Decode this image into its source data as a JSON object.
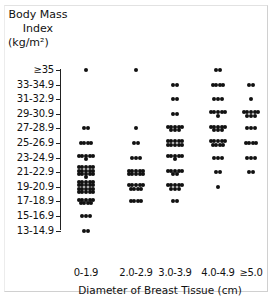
{
  "chart_data": {
    "type": "scatter",
    "subtype": "dot-strip-plot",
    "title": "",
    "ylabel": "Body Mass Index (kg/m²)",
    "ylabel_lines": [
      "Body Mass",
      "Index",
      "(kg/m²)"
    ],
    "xlabel": "Diameter of Breast Tissue (cm)",
    "y_categories": [
      "≥35",
      "33-34.9",
      "31-32.9",
      "29-30.9",
      "27-28.9",
      "25-26.9",
      "23-24.9",
      "21-22.9",
      "19-20.9",
      "17-18.9",
      "15-16.9",
      "13-14.9"
    ],
    "x_categories": [
      "0-1.9",
      "2.0-2.9",
      "3.0-3.9",
      "4.0-4.9",
      "≥5.0"
    ],
    "grid": false,
    "legend": null,
    "counts_by_column": {
      "0-1.9": {
        "≥35": 1,
        "33-34.9": 0,
        "31-32.9": 0,
        "29-30.9": 0,
        "27-28.9": 2,
        "25-26.9": 4,
        "23-24.9": 6,
        "21-22.9": 16,
        "19-20.9": 20,
        "17-18.9": 9,
        "15-16.9": 3,
        "13-14.9": 2
      },
      "2.0-2.9": {
        "≥35": 1,
        "33-34.9": 0,
        "31-32.9": 0,
        "29-30.9": 0,
        "27-28.9": 1,
        "25-26.9": 2,
        "23-24.9": 3,
        "21-22.9": 10,
        "19-20.9": 9,
        "17-18.9": 4,
        "15-16.9": 0,
        "13-14.9": 0
      },
      "3.0-3.9": {
        "≥35": 0,
        "33-34.9": 2,
        "31-32.9": 2,
        "29-30.9": 2,
        "27-28.9": 8,
        "25-26.9": 10,
        "23-24.9": 6,
        "21-22.9": 7,
        "19-20.9": 8,
        "17-18.9": 2,
        "15-16.9": 0,
        "13-14.9": 0
      },
      "4.0-4.9": {
        "≥35": 2,
        "33-34.9": 4,
        "31-32.9": 3,
        "29-30.9": 6,
        "27-28.9": 8,
        "25-26.9": 9,
        "23-24.9": 3,
        "21-22.9": 2,
        "19-20.9": 1,
        "17-18.9": 0,
        "15-16.9": 0,
        "13-14.9": 0
      },
      "≥5.0": {
        "≥35": 0,
        "33-34.9": 2,
        "31-32.9": 1,
        "29-30.9": 8,
        "27-28.9": 3,
        "25-26.9": 4,
        "23-24.9": 3,
        "21-22.9": 2,
        "19-20.9": 0,
        "17-18.9": 0,
        "15-16.9": 0,
        "13-14.9": 0
      }
    }
  }
}
